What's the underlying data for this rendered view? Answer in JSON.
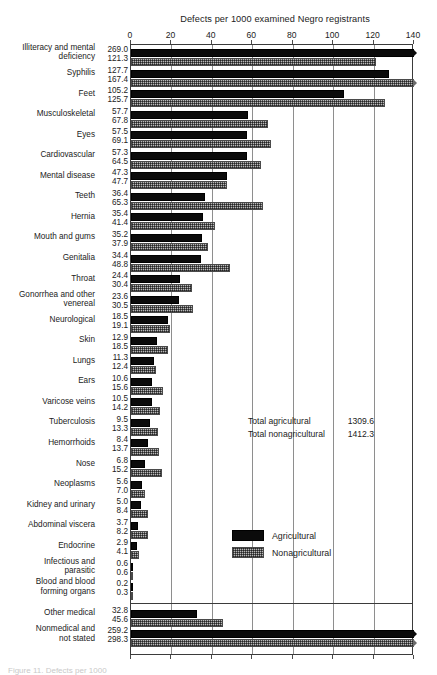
{
  "chart_data": {
    "type": "bar",
    "orientation": "horizontal",
    "title": "Defects per 1000 examined Negro registrants",
    "xlabel": "",
    "ylabel": "",
    "xlim": [
      0,
      140
    ],
    "xticks": [
      0,
      20,
      40,
      60,
      80,
      100,
      120,
      140
    ],
    "xtick_labels": [
      "0",
      "20",
      "40",
      "60",
      "80",
      "100",
      "120",
      "140"
    ],
    "grid": "vertical",
    "legend_position": "center-right",
    "note": "Bars for values above 140 are clipped at the axis maximum and marked with an overflow arrow.",
    "categories": [
      "Illiteracy and mental deficiency",
      "Syphilis",
      "Feet",
      "Musculoskeletal",
      "Eyes",
      "Cardiovascular",
      "Mental disease",
      "Teeth",
      "Hernia",
      "Mouth and gums",
      "Genitalia",
      "Throat",
      "Gonorrhea and other venereal",
      "Neurological",
      "Skin",
      "Lungs",
      "Ears",
      "Varicose veins",
      "Tuberculosis",
      "Hemorrhoids",
      "Nose",
      "Neoplasms",
      "Kidney and urinary",
      "Abdominal viscera",
      "Endocrine",
      "Infectious and parasitic",
      "Blood and blood forming organs",
      "Other medical",
      "Nonmedical and not stated"
    ],
    "series": [
      {
        "name": "Agricultural",
        "color": "#0b0b0b",
        "values": [
          269.0,
          127.7,
          105.2,
          57.7,
          57.5,
          57.3,
          47.3,
          36.4,
          35.4,
          35.2,
          34.4,
          24.4,
          23.6,
          18.5,
          12.9,
          11.3,
          10.6,
          10.5,
          9.5,
          8.4,
          6.8,
          5.6,
          5.0,
          3.7,
          2.9,
          0.6,
          0.2,
          32.8,
          259.2
        ]
      },
      {
        "name": "Nonagricultural",
        "color": "#b9b9b9",
        "values": [
          121.3,
          167.4,
          125.7,
          67.8,
          69.1,
          64.5,
          47.7,
          65.3,
          41.4,
          37.9,
          48.8,
          30.4,
          30.5,
          19.1,
          18.5,
          12.4,
          15.6,
          14.2,
          13.3,
          13.7,
          15.2,
          7.0,
          8.4,
          8.2,
          4.1,
          0.6,
          0.3,
          45.6,
          298.3
        ]
      }
    ],
    "totals": [
      {
        "label": "Total agricultural",
        "value": "1309.6"
      },
      {
        "label": "Total nonagricultural",
        "value": "1412.3"
      }
    ]
  },
  "rows": [
    {
      "label_line1": "Illiteracy and mental",
      "label_line2": "deficiency",
      "agri": "269.0",
      "nonagri": "121.3"
    },
    {
      "label_line1": "Syphilis",
      "label_line2": "",
      "agri": "127.7",
      "nonagri": "167.4"
    },
    {
      "label_line1": "Feet",
      "label_line2": "",
      "agri": "105.2",
      "nonagri": "125.7"
    },
    {
      "label_line1": "Musculoskeletal",
      "label_line2": "",
      "agri": "57.7",
      "nonagri": "67.8"
    },
    {
      "label_line1": "Eyes",
      "label_line2": "",
      "agri": "57.5",
      "nonagri": "69.1"
    },
    {
      "label_line1": "Cardiovascular",
      "label_line2": "",
      "agri": "57.3",
      "nonagri": "64.5"
    },
    {
      "label_line1": "Mental disease",
      "label_line2": "",
      "agri": "47.3",
      "nonagri": "47.7"
    },
    {
      "label_line1": "Teeth",
      "label_line2": "",
      "agri": "36.4",
      "nonagri": "65.3"
    },
    {
      "label_line1": "Hernia",
      "label_line2": "",
      "agri": "35.4",
      "nonagri": "41.4"
    },
    {
      "label_line1": "Mouth and gums",
      "label_line2": "",
      "agri": "35.2",
      "nonagri": "37.9"
    },
    {
      "label_line1": "Genitalia",
      "label_line2": "",
      "agri": "34.4",
      "nonagri": "48.8"
    },
    {
      "label_line1": "Throat",
      "label_line2": "",
      "agri": "24.4",
      "nonagri": "30.4"
    },
    {
      "label_line1": "Gonorrhea and other",
      "label_line2": "venereal",
      "agri": "23.6",
      "nonagri": "30.5"
    },
    {
      "label_line1": "Neurological",
      "label_line2": "",
      "agri": "18.5",
      "nonagri": "19.1"
    },
    {
      "label_line1": "Skin",
      "label_line2": "",
      "agri": "12.9",
      "nonagri": "18.5"
    },
    {
      "label_line1": "Lungs",
      "label_line2": "",
      "agri": "11.3",
      "nonagri": "12.4"
    },
    {
      "label_line1": "Ears",
      "label_line2": "",
      "agri": "10.6",
      "nonagri": "15.6"
    },
    {
      "label_line1": "Varicose veins",
      "label_line2": "",
      "agri": "10.5",
      "nonagri": "14.2"
    },
    {
      "label_line1": "Tuberculosis",
      "label_line2": "",
      "agri": "9.5",
      "nonagri": "13.3"
    },
    {
      "label_line1": "Hemorrhoids",
      "label_line2": "",
      "agri": "8.4",
      "nonagri": "13.7"
    },
    {
      "label_line1": "Nose",
      "label_line2": "",
      "agri": "6.8",
      "nonagri": "15.2"
    },
    {
      "label_line1": "Neoplasms",
      "label_line2": "",
      "agri": "5.6",
      "nonagri": "7.0"
    },
    {
      "label_line1": "Kidney and urinary",
      "label_line2": "",
      "agri": "5.0",
      "nonagri": "8.4"
    },
    {
      "label_line1": "Abdominal viscera",
      "label_line2": "",
      "agri": "3.7",
      "nonagri": "8.2"
    },
    {
      "label_line1": "Endocrine",
      "label_line2": "",
      "agri": "2.9",
      "nonagri": "4.1"
    },
    {
      "label_line1": "Infectious and",
      "label_line2": "parasitic",
      "agri": "0.6",
      "nonagri": "0.6"
    },
    {
      "label_line1": "Blood and blood",
      "label_line2": "forming organs",
      "agri": "0.2",
      "nonagri": "0.3"
    },
    {
      "label_line1": "Other medical",
      "label_line2": "",
      "agri": "32.8",
      "nonagri": "45.6"
    },
    {
      "label_line1": "Nonmedical and",
      "label_line2": "not stated",
      "agri": "259.2",
      "nonagri": "298.3"
    }
  ],
  "legend": {
    "items": [
      {
        "label": "Agricultural",
        "kind": "agri"
      },
      {
        "label": "Nonagricultural",
        "kind": "nonagri"
      }
    ]
  },
  "caption": {
    "text": "Figure 11. Defects per 1000"
  },
  "colors": {
    "agricultural": "#0b0b0b",
    "nonagricultural": "#b9b9b9",
    "axis": "#3b3b3b",
    "grid": "#8e8e8e"
  }
}
